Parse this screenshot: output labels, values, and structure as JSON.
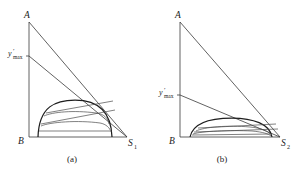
{
  "figure": {
    "background_color": "#ffffff",
    "line_color": "#3a3a3a",
    "curve_color": "#1e1e1e",
    "panels": [
      {
        "caption": "(a)",
        "labels": {
          "apex": "A",
          "origin": "B",
          "right_vertex": "S",
          "right_vertex_sub": "1",
          "ymax_var": "y",
          "ymax_prime": "′",
          "ymax_sub": "max"
        },
        "geometry": {
          "axis_x": 29,
          "apex_y": 22,
          "base_y": 137,
          "right_x": 127,
          "ymax_y": 56,
          "dome_left_x": 38,
          "dome_right_x": 112,
          "dome_apex_y": 100,
          "dome_apex_x": 75,
          "chord_count": 4
        }
      },
      {
        "caption": "(b)",
        "labels": {
          "apex": "A",
          "origin": "B",
          "right_vertex": "S",
          "right_vertex_sub": "2",
          "ymax_var": "y",
          "ymax_prime": "′",
          "ymax_sub": "max"
        },
        "geometry": {
          "axis_x": 180,
          "apex_y": 22,
          "base_y": 137,
          "right_x": 280,
          "ymax_y": 95,
          "dome_left_x": 190,
          "dome_right_x": 272,
          "dome_apex_y": 118,
          "dome_apex_x": 232,
          "chord_count": 4
        }
      }
    ]
  }
}
